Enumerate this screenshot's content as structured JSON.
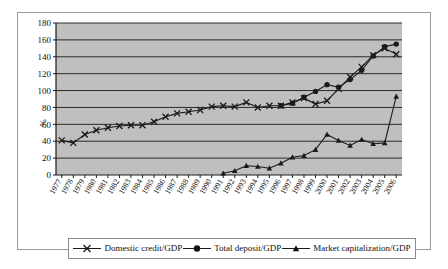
{
  "chart_data": {
    "type": "line",
    "title": "",
    "xlabel": "",
    "ylabel": "%",
    "ylim": [
      0,
      180
    ],
    "ytick_step": 20,
    "yticks": [
      0,
      20,
      40,
      60,
      80,
      100,
      120,
      140,
      160,
      180
    ],
    "grid": true,
    "grid_axis": "y",
    "legend_position": "bottom",
    "plot_background": "#bfbfbf",
    "categories": [
      "1977",
      "1978",
      "1979",
      "1980",
      "1981",
      "1982",
      "1983",
      "1984",
      "1985",
      "1986",
      "1987",
      "1988",
      "1989",
      "1990",
      "1991",
      "1992",
      "1993",
      "1994",
      "1995",
      "1996",
      "1997",
      "1998",
      "1999",
      "2000",
      "2001",
      "2002",
      "2003",
      "2004",
      "2005",
      "2006"
    ],
    "series": [
      {
        "name": "Domestic credit/GDP",
        "marker": "x",
        "color": "#1a1a1a",
        "values": [
          41,
          38,
          48,
          53,
          56,
          58,
          59,
          59,
          63,
          69,
          73,
          75,
          77,
          81,
          82,
          81,
          86,
          80,
          82,
          82,
          86,
          91,
          84,
          88,
          102,
          116,
          128,
          142,
          150,
          143
        ]
      },
      {
        "name": "Total deposit/GDP",
        "marker": "circle",
        "color": "#1a1a1a",
        "values": [
          null,
          null,
          null,
          null,
          null,
          null,
          null,
          null,
          null,
          null,
          null,
          null,
          null,
          null,
          null,
          null,
          null,
          null,
          null,
          82,
          85,
          92,
          99,
          107,
          104,
          113,
          124,
          141,
          152,
          155
        ]
      },
      {
        "name": "Market capitalization/GDP",
        "marker": "triangle",
        "color": "#1a1a1a",
        "values": [
          null,
          null,
          null,
          null,
          null,
          null,
          null,
          null,
          null,
          null,
          null,
          null,
          null,
          null,
          2,
          5,
          11,
          10,
          8,
          14,
          21,
          23,
          30,
          48,
          41,
          35,
          42,
          37,
          38,
          93
        ]
      }
    ]
  },
  "legend": {
    "items": [
      {
        "label": "Domestic credit/GDP",
        "marker": "x"
      },
      {
        "label": "Total deposit/GDP",
        "marker": "circle"
      },
      {
        "label": "Market capitalization/GDP",
        "marker": "triangle"
      }
    ]
  }
}
